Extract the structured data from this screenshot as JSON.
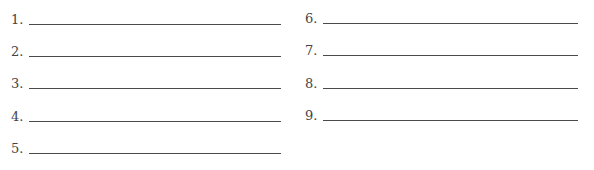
{
  "answer_blanks": {
    "left_column": [
      {
        "label": "1.",
        "value": ""
      },
      {
        "label": "2.",
        "value": ""
      },
      {
        "label": "3.",
        "value": ""
      },
      {
        "label": "4.",
        "value": ""
      },
      {
        "label": "5.",
        "value": ""
      }
    ],
    "right_column": [
      {
        "label": "6.",
        "value": ""
      },
      {
        "label": "7.",
        "value": ""
      },
      {
        "label": "8.",
        "value": ""
      },
      {
        "label": "9.",
        "value": ""
      }
    ]
  }
}
